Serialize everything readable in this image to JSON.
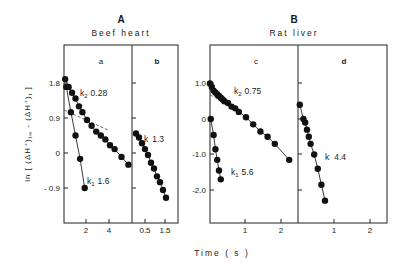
{
  "chart_data": [
    {
      "type": "scatter",
      "panel": "a",
      "group": "A",
      "group_title": "Beef heart",
      "xlabel": "Time (s)",
      "ylabel": "ln [ (ΔH⁺)t∞ - (ΔH⁺)t ]",
      "yticks": [
        1.8,
        0.9,
        0,
        -0.9
      ],
      "xticks": [
        2,
        4
      ],
      "series": [
        {
          "name": "k2 0.28",
          "label": "k2",
          "value": "0.28",
          "x": [
            0.1,
            0.4,
            0.7,
            1.0,
            1.3,
            1.6,
            2.0,
            2.4,
            2.8,
            3.2,
            3.6,
            4.0,
            4.4,
            5.0,
            5.6
          ],
          "y": [
            1.9,
            1.7,
            1.55,
            1.4,
            1.2,
            1.05,
            0.85,
            0.7,
            0.55,
            0.45,
            0.35,
            0.2,
            0.1,
            -0.1,
            -0.3
          ]
        },
        {
          "name": "k1 1.6",
          "label": "k1",
          "value": "1.6",
          "x": [
            0.2,
            0.6,
            1.0,
            1.4,
            1.8
          ],
          "y": [
            1.7,
            1.05,
            0.45,
            -0.15,
            -0.9
          ]
        }
      ]
    },
    {
      "type": "scatter",
      "panel": "b",
      "group": "A",
      "xticks": [
        0.5,
        1.5
      ],
      "series": [
        {
          "name": "k 1.3",
          "label": "k",
          "value": "1.3",
          "x": [
            0.05,
            0.2,
            0.35,
            0.5,
            0.65,
            0.8,
            0.95,
            1.1,
            1.25,
            1.4,
            1.55
          ],
          "y": [
            0.5,
            0.4,
            0.25,
            0.1,
            -0.05,
            -0.25,
            -0.4,
            -0.6,
            -0.75,
            -0.95,
            -1.15
          ]
        }
      ]
    },
    {
      "type": "scatter",
      "panel": "c",
      "group": "B",
      "group_title": "Rat liver",
      "yticks": [
        1.0,
        0,
        -1.0,
        -2.0
      ],
      "xticks": [
        1,
        2
      ],
      "series": [
        {
          "name": "k2 0.75",
          "label": "k2",
          "value": "0.75",
          "x": [
            0.0,
            0.05,
            0.1,
            0.15,
            0.2,
            0.25,
            0.3,
            0.35,
            0.4,
            0.5,
            0.6,
            0.7,
            0.8,
            1.0,
            1.2,
            1.4,
            1.6,
            1.8,
            2.2
          ],
          "y": [
            1.0,
            0.9,
            0.8,
            0.75,
            0.7,
            0.65,
            0.6,
            0.55,
            0.5,
            0.45,
            0.35,
            0.3,
            0.2,
            0.05,
            -0.15,
            -0.35,
            -0.5,
            -0.7,
            -1.15
          ]
        },
        {
          "name": "k1 5.6",
          "label": "k1",
          "value": "5.6",
          "x": [
            0.02,
            0.1,
            0.15,
            0.2,
            0.25,
            0.3
          ],
          "y": [
            0.0,
            -0.45,
            -0.85,
            -1.15,
            -1.45,
            -1.7
          ]
        }
      ]
    },
    {
      "type": "scatter",
      "panel": "d",
      "group": "B",
      "xticks": [
        1,
        2
      ],
      "series": [
        {
          "name": "k 4.4",
          "label": "k",
          "value": "4.4",
          "x": [
            0.05,
            0.15,
            0.2,
            0.25,
            0.3,
            0.35,
            0.45,
            0.55,
            0.65,
            0.75
          ],
          "y": [
            0.4,
            0.0,
            -0.1,
            -0.3,
            -0.5,
            -0.7,
            -1.0,
            -1.4,
            -1.85,
            -2.3
          ]
        }
      ]
    }
  ],
  "figure": {
    "group_a_letter": "A",
    "group_a_title": "Beef heart",
    "group_b_letter": "B",
    "group_b_title": "Rat liver",
    "panel_a": "a",
    "panel_b": "b",
    "panel_c": "c",
    "panel_d": "d",
    "ylabel_main": "ln [ (ΔH⁺)",
    "ylabel_sub1": "t∞",
    "ylabel_mid": " - (ΔH⁺)",
    "ylabel_sub2": "t",
    "ylabel_end": " ]",
    "xlabel": "Time  ( s )",
    "yticks_a": [
      "1.8",
      "0.9",
      "0",
      "- 0.9"
    ],
    "yticks_b": [
      "1.0",
      "0",
      "-1.0",
      "-2.0"
    ],
    "xticks_a": [
      "2",
      "4"
    ],
    "xticks_b": [
      "0.5",
      "1.5"
    ],
    "xticks_c": [
      "1",
      "2"
    ],
    "xticks_d": [
      "1",
      "2"
    ],
    "ann_a_k2": "k",
    "ann_a_k2_sub": "2",
    "ann_a_k2_val": "0.28",
    "ann_a_k1": "k",
    "ann_a_k1_sub": "1",
    "ann_a_k1_val": "1.6",
    "ann_b_k": "k",
    "ann_b_k_val": "1.3",
    "ann_c_k2": "k",
    "ann_c_k2_sub": "2",
    "ann_c_k2_val": "0.75",
    "ann_c_k1": "k",
    "ann_c_k1_sub": "1",
    "ann_c_k1_val": "5.6",
    "ann_d_k": "k",
    "ann_d_k_val": "4.4"
  }
}
